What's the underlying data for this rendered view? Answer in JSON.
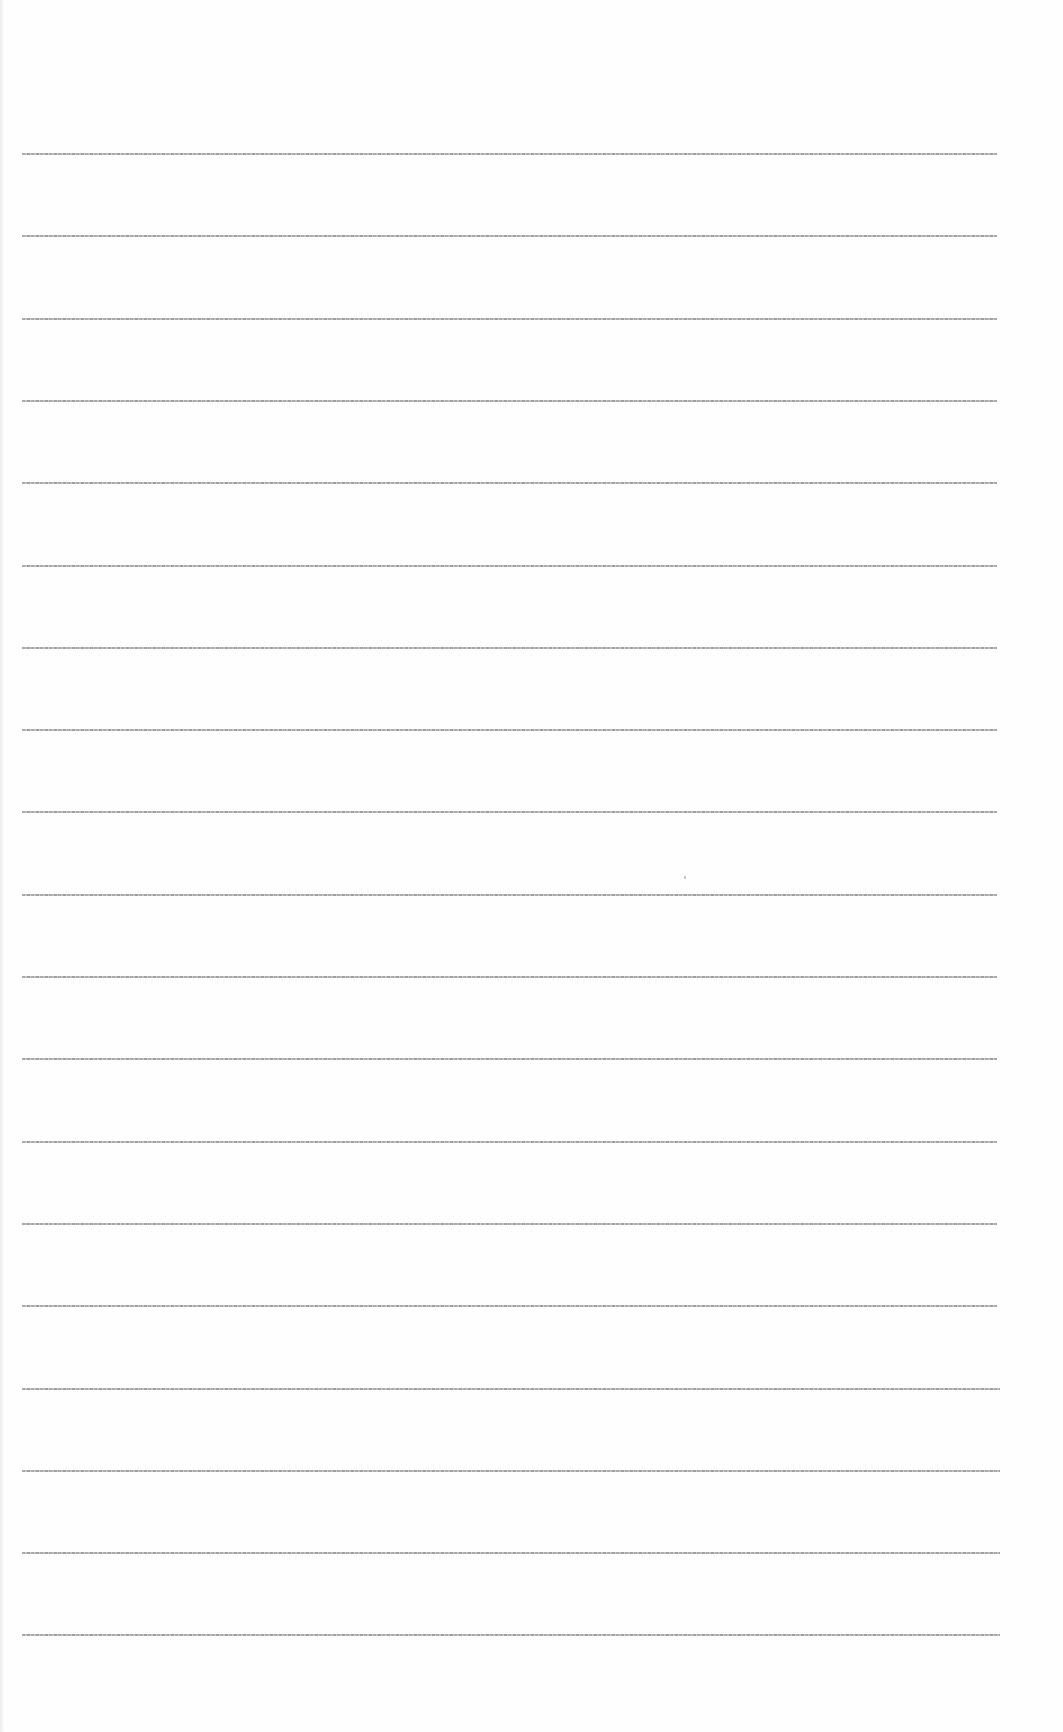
{
  "document": {
    "type": "blank lined paper",
    "text_content": "",
    "background_color": "#fefefe",
    "rule_color": "#9c9c9c",
    "rules": {
      "count": 19,
      "first_y": 153,
      "spacing": 82.3,
      "x_start": 22,
      "x_end": 997
    }
  }
}
